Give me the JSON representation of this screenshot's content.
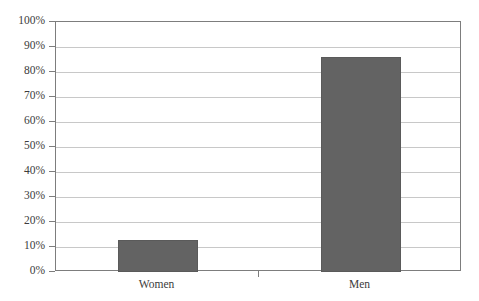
{
  "chart_data": {
    "type": "bar",
    "title": "",
    "subtitle": "",
    "xlabel": "",
    "ylabel": "",
    "categories": [
      "Women",
      "Men"
    ],
    "values": [
      13,
      86
    ],
    "series": [
      {
        "name": "",
        "values": [
          13,
          86
        ]
      }
    ],
    "ylim": [
      0,
      100
    ],
    "ytick_labels": [
      "100%",
      "90%",
      "80%",
      "70%",
      "60%",
      "50%",
      "40%",
      "30%",
      "20%",
      "10%",
      "0%"
    ],
    "ytick_values": [
      100,
      90,
      80,
      70,
      60,
      50,
      40,
      30,
      20,
      10,
      0
    ],
    "value_suffix": "%",
    "grid": true,
    "grid_axis": "y",
    "legend": false,
    "legend_position": "none",
    "annotations": [],
    "colors": {
      "bar_fill": "#636363",
      "bar_border": "#5a5a5a",
      "gridline": "#c8c8c8",
      "axis_line": "#7d7d7d",
      "text": "#3c3c3c",
      "background": "#ffffff"
    }
  }
}
